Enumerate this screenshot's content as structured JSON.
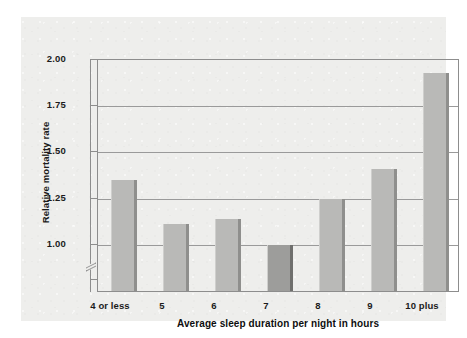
{
  "chart_data": {
    "type": "bar",
    "title": "",
    "xlabel": "Average sleep duration per night in hours",
    "ylabel": "Relative mortality rate",
    "categories": [
      "4 or less",
      "5",
      "6",
      "7",
      "8",
      "9",
      "10 plus"
    ],
    "values": [
      1.35,
      1.11,
      1.14,
      1.0,
      1.25,
      1.41,
      1.93
    ],
    "ylim": [
      0.75,
      2.0
    ],
    "yticks": [
      "1.00",
      "1.25",
      "1.50",
      "1.75",
      "2.00"
    ],
    "ytick_values": [
      1.0,
      1.25,
      1.5,
      1.75,
      2.0
    ],
    "grid": true,
    "legend": "none",
    "axis_break": true,
    "axis_break_note": "y-axis broken below 1.00",
    "highlight_category": "7",
    "colors": {
      "bar": "#b9b9b7",
      "bar_shade": "#8f8f8d",
      "bar_highlight": "#9d9d9b",
      "bar_highlight_shade": "#6f6f6d",
      "panel_background": "#eeeeec",
      "gridline": "#9a9a9a",
      "axis": "#8d8d8d",
      "text": "#1b1b1b"
    }
  }
}
